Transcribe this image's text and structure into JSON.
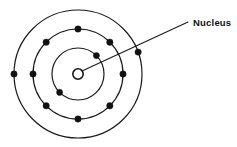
{
  "diagram": {
    "background_color": "#ffffff",
    "line_color": "#1a1a1a",
    "electron_color": "#111111",
    "label": {
      "text": "Nucleus",
      "x": 193,
      "y": 26,
      "font_size": 9.5,
      "color": "#111111"
    },
    "leader_line": {
      "from_x": 82,
      "from_y": 71,
      "to_x": 188,
      "to_y": 22
    },
    "center": {
      "x": 78,
      "y": 74
    },
    "nucleus": {
      "name": "nucleus",
      "radius": 5.2,
      "fill": "#ffffff",
      "stroke": "#1a1a1a"
    },
    "shells": [
      {
        "name": "inner-shell",
        "index": 1,
        "radius": 26,
        "stroke_width": 1.2,
        "electron_count": 2,
        "electron_radius": 3.1,
        "electron_angles": [
          -45,
          135
        ]
      },
      {
        "name": "middle-shell",
        "index": 2,
        "radius": 45,
        "stroke_width": 1.2,
        "electron_count": 8,
        "electron_radius": 3.2,
        "electron_angles": [
          -90,
          -45,
          0,
          45,
          90,
          135,
          180,
          225
        ]
      },
      {
        "name": "outer-shell",
        "index": 3,
        "radius": 64,
        "stroke_width": 1.2,
        "electron_count": 2,
        "electron_radius": 3.2,
        "electron_angles": [
          -20,
          180
        ]
      }
    ]
  },
  "chart_data": {
    "type": "diagram",
    "annotations": [
      "Nucleus"
    ],
    "shell_electron_counts": [
      2,
      8,
      2
    ],
    "shell_radii": [
      26,
      45,
      64
    ],
    "nucleus_radius": 5.2
  }
}
